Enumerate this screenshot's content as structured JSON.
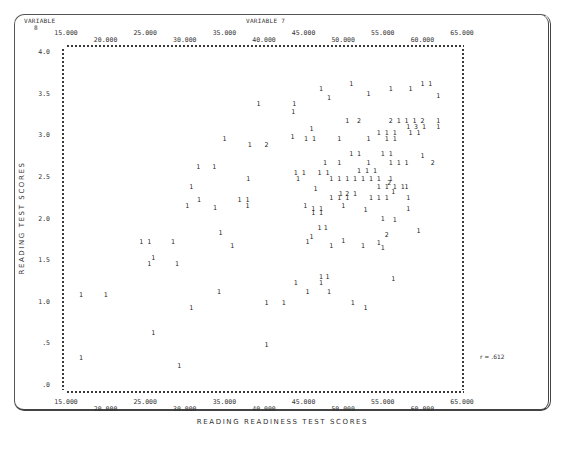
{
  "chart_data": {
    "type": "scatter",
    "title": "",
    "variable_y_label": "VARIABLE\n8",
    "variable_x_label": "VARIABLE 7",
    "xlabel": "READING READINESS TEST SCORES",
    "ylabel": "READING TEST SCORES",
    "annotation": "r = .612",
    "xlim": [
      15,
      65
    ],
    "ylim": [
      0,
      4
    ],
    "grid": false,
    "x_ticks_top_upper": [
      "15.000",
      "25.000",
      "35.000",
      "45.000",
      "55.000",
      "65.000"
    ],
    "x_ticks_top_lower": [
      "20.000",
      "30.000",
      "40.000",
      "50.000",
      "60.000"
    ],
    "x_ticks_bottom_upper": [
      "15.000",
      "25.000",
      "35.000",
      "45.000",
      "55.000",
      "65.000"
    ],
    "x_ticks_bottom_lower": [
      "20.000",
      "30.000",
      "40.000",
      "50.000",
      "60.000"
    ],
    "x_tick_values": [
      15,
      20,
      25,
      30,
      35,
      40,
      45,
      50,
      55,
      60,
      65
    ],
    "y_ticks": [
      "4.0",
      "3.5",
      "3.0",
      "2.5",
      "2.0",
      "1.5",
      "1.0",
      ".5",
      ".0"
    ],
    "y_tick_values": [
      4.0,
      3.5,
      3.0,
      2.5,
      2.0,
      1.5,
      1.0,
      0.5,
      0.0
    ],
    "points": [
      {
        "x": 16.9,
        "y": 1.08,
        "n": 1
      },
      {
        "x": 20.0,
        "y": 1.08,
        "n": 1
      },
      {
        "x": 16.9,
        "y": 0.33,
        "n": 1
      },
      {
        "x": 24.5,
        "y": 1.72,
        "n": 1
      },
      {
        "x": 25.5,
        "y": 1.72,
        "n": 1
      },
      {
        "x": 28.5,
        "y": 1.72,
        "n": 1
      },
      {
        "x": 26.0,
        "y": 1.52,
        "n": 1
      },
      {
        "x": 25.5,
        "y": 1.45,
        "n": 1
      },
      {
        "x": 29.0,
        "y": 1.45,
        "n": 1
      },
      {
        "x": 26.0,
        "y": 0.62,
        "n": 1
      },
      {
        "x": 29.3,
        "y": 0.23,
        "n": 1
      },
      {
        "x": 31.7,
        "y": 2.62,
        "n": 1
      },
      {
        "x": 33.7,
        "y": 2.62,
        "n": 1
      },
      {
        "x": 30.8,
        "y": 2.38,
        "n": 1
      },
      {
        "x": 31.8,
        "y": 2.22,
        "n": 1
      },
      {
        "x": 30.3,
        "y": 2.15,
        "n": 1
      },
      {
        "x": 33.8,
        "y": 2.13,
        "n": 1
      },
      {
        "x": 36.9,
        "y": 2.22,
        "n": 1
      },
      {
        "x": 37.9,
        "y": 2.22,
        "n": 1
      },
      {
        "x": 37.9,
        "y": 2.15,
        "n": 1
      },
      {
        "x": 35.0,
        "y": 2.95,
        "n": 1
      },
      {
        "x": 38.2,
        "y": 2.88,
        "n": 1
      },
      {
        "x": 40.3,
        "y": 2.88,
        "n": 2
      },
      {
        "x": 38.0,
        "y": 2.48,
        "n": 1
      },
      {
        "x": 34.5,
        "y": 1.82,
        "n": 1
      },
      {
        "x": 36.0,
        "y": 1.67,
        "n": 1
      },
      {
        "x": 34.3,
        "y": 1.12,
        "n": 1
      },
      {
        "x": 30.8,
        "y": 0.93,
        "n": 1
      },
      {
        "x": 39.3,
        "y": 3.37,
        "n": 1
      },
      {
        "x": 43.7,
        "y": 3.28,
        "n": 1
      },
      {
        "x": 43.8,
        "y": 3.37,
        "n": 1
      },
      {
        "x": 47.2,
        "y": 3.55,
        "n": 1
      },
      {
        "x": 48.2,
        "y": 3.45,
        "n": 1
      },
      {
        "x": 51.0,
        "y": 3.62,
        "n": 1
      },
      {
        "x": 53.2,
        "y": 3.5,
        "n": 1
      },
      {
        "x": 56.0,
        "y": 3.55,
        "n": 1
      },
      {
        "x": 58.5,
        "y": 3.55,
        "n": 1
      },
      {
        "x": 60.0,
        "y": 3.62,
        "n": 1
      },
      {
        "x": 61.0,
        "y": 3.62,
        "n": 1
      },
      {
        "x": 62.0,
        "y": 3.47,
        "n": 1
      },
      {
        "x": 50.5,
        "y": 3.17,
        "n": 1
      },
      {
        "x": 52.0,
        "y": 3.17,
        "n": 2
      },
      {
        "x": 56.0,
        "y": 3.17,
        "n": 2
      },
      {
        "x": 57.0,
        "y": 3.17,
        "n": 1
      },
      {
        "x": 58.0,
        "y": 3.17,
        "n": 1
      },
      {
        "x": 59.0,
        "y": 3.17,
        "n": 1
      },
      {
        "x": 60.0,
        "y": 3.17,
        "n": 2
      },
      {
        "x": 62.0,
        "y": 3.17,
        "n": 1
      },
      {
        "x": 58.2,
        "y": 3.1,
        "n": 1
      },
      {
        "x": 59.2,
        "y": 3.1,
        "n": 3
      },
      {
        "x": 60.2,
        "y": 3.1,
        "n": 1
      },
      {
        "x": 62.0,
        "y": 3.1,
        "n": 1
      },
      {
        "x": 46.0,
        "y": 3.07,
        "n": 1
      },
      {
        "x": 54.5,
        "y": 3.03,
        "n": 1
      },
      {
        "x": 55.5,
        "y": 3.03,
        "n": 1
      },
      {
        "x": 56.5,
        "y": 3.03,
        "n": 1
      },
      {
        "x": 58.5,
        "y": 3.03,
        "n": 1
      },
      {
        "x": 59.5,
        "y": 3.03,
        "n": 1
      },
      {
        "x": 43.6,
        "y": 2.98,
        "n": 1
      },
      {
        "x": 45.3,
        "y": 2.95,
        "n": 1
      },
      {
        "x": 46.3,
        "y": 2.95,
        "n": 1
      },
      {
        "x": 49.5,
        "y": 2.95,
        "n": 1
      },
      {
        "x": 53.2,
        "y": 2.95,
        "n": 1
      },
      {
        "x": 55.5,
        "y": 2.95,
        "n": 1
      },
      {
        "x": 56.5,
        "y": 2.95,
        "n": 1
      },
      {
        "x": 47.7,
        "y": 2.67,
        "n": 1
      },
      {
        "x": 49.5,
        "y": 2.67,
        "n": 1
      },
      {
        "x": 53.2,
        "y": 2.67,
        "n": 1
      },
      {
        "x": 56.0,
        "y": 2.67,
        "n": 1
      },
      {
        "x": 57.0,
        "y": 2.67,
        "n": 1
      },
      {
        "x": 58.0,
        "y": 2.67,
        "n": 1
      },
      {
        "x": 61.3,
        "y": 2.67,
        "n": 2
      },
      {
        "x": 52.0,
        "y": 2.57,
        "n": 1
      },
      {
        "x": 53.0,
        "y": 2.57,
        "n": 1
      },
      {
        "x": 54.0,
        "y": 2.57,
        "n": 1
      },
      {
        "x": 48.5,
        "y": 2.48,
        "n": 1
      },
      {
        "x": 49.5,
        "y": 2.48,
        "n": 1
      },
      {
        "x": 50.5,
        "y": 2.48,
        "n": 1
      },
      {
        "x": 51.5,
        "y": 2.48,
        "n": 1
      },
      {
        "x": 52.5,
        "y": 2.48,
        "n": 1
      },
      {
        "x": 53.5,
        "y": 2.48,
        "n": 1
      },
      {
        "x": 54.5,
        "y": 2.48,
        "n": 1
      },
      {
        "x": 56.0,
        "y": 2.48,
        "n": 1
      },
      {
        "x": 54.5,
        "y": 2.38,
        "n": 1
      },
      {
        "x": 55.5,
        "y": 2.38,
        "n": 1
      },
      {
        "x": 56.5,
        "y": 2.38,
        "n": 1
      },
      {
        "x": 57.5,
        "y": 2.38,
        "n": 1
      },
      {
        "x": 58.0,
        "y": 2.38,
        "n": 1
      },
      {
        "x": 44.0,
        "y": 2.55,
        "n": 1
      },
      {
        "x": 45.0,
        "y": 2.55,
        "n": 1
      },
      {
        "x": 47.0,
        "y": 2.55,
        "n": 1
      },
      {
        "x": 48.0,
        "y": 2.55,
        "n": 1
      },
      {
        "x": 44.3,
        "y": 2.48,
        "n": 1
      },
      {
        "x": 51.0,
        "y": 2.78,
        "n": 1
      },
      {
        "x": 52.0,
        "y": 2.78,
        "n": 1
      },
      {
        "x": 55.0,
        "y": 2.78,
        "n": 1
      },
      {
        "x": 56.0,
        "y": 2.78,
        "n": 1
      },
      {
        "x": 60.0,
        "y": 2.75,
        "n": 1
      },
      {
        "x": 46.5,
        "y": 2.35,
        "n": 1
      },
      {
        "x": 49.7,
        "y": 2.3,
        "n": 1
      },
      {
        "x": 50.5,
        "y": 2.3,
        "n": 2
      },
      {
        "x": 51.5,
        "y": 2.3,
        "n": 1
      },
      {
        "x": 56.3,
        "y": 2.32,
        "n": 1
      },
      {
        "x": 55.8,
        "y": 2.43,
        "n": 2
      },
      {
        "x": 48.5,
        "y": 2.25,
        "n": 1
      },
      {
        "x": 49.5,
        "y": 2.25,
        "n": 1
      },
      {
        "x": 50.5,
        "y": 2.25,
        "n": 1
      },
      {
        "x": 53.5,
        "y": 2.25,
        "n": 1
      },
      {
        "x": 54.5,
        "y": 2.25,
        "n": 1
      },
      {
        "x": 55.5,
        "y": 2.25,
        "n": 1
      },
      {
        "x": 58.2,
        "y": 2.25,
        "n": 1
      },
      {
        "x": 45.2,
        "y": 2.15,
        "n": 1
      },
      {
        "x": 46.2,
        "y": 2.12,
        "n": 1
      },
      {
        "x": 47.2,
        "y": 2.12,
        "n": 1
      },
      {
        "x": 46.2,
        "y": 2.07,
        "n": 1
      },
      {
        "x": 47.2,
        "y": 2.07,
        "n": 1
      },
      {
        "x": 50.0,
        "y": 2.15,
        "n": 1
      },
      {
        "x": 52.8,
        "y": 2.1,
        "n": 1
      },
      {
        "x": 58.2,
        "y": 2.12,
        "n": 1
      },
      {
        "x": 55.0,
        "y": 2.0,
        "n": 1
      },
      {
        "x": 56.5,
        "y": 1.98,
        "n": 1
      },
      {
        "x": 47.0,
        "y": 1.88,
        "n": 1
      },
      {
        "x": 47.8,
        "y": 1.88,
        "n": 1
      },
      {
        "x": 46.0,
        "y": 1.78,
        "n": 1
      },
      {
        "x": 45.5,
        "y": 1.72,
        "n": 1
      },
      {
        "x": 50.0,
        "y": 1.73,
        "n": 1
      },
      {
        "x": 54.5,
        "y": 1.7,
        "n": 1
      },
      {
        "x": 55.5,
        "y": 1.8,
        "n": 2
      },
      {
        "x": 59.5,
        "y": 1.85,
        "n": 1
      },
      {
        "x": 55.0,
        "y": 1.65,
        "n": 1
      },
      {
        "x": 48.5,
        "y": 1.67,
        "n": 1
      },
      {
        "x": 52.5,
        "y": 1.67,
        "n": 1
      },
      {
        "x": 47.2,
        "y": 1.3,
        "n": 1
      },
      {
        "x": 47.2,
        "y": 1.22,
        "n": 1
      },
      {
        "x": 45.5,
        "y": 1.12,
        "n": 1
      },
      {
        "x": 48.2,
        "y": 1.12,
        "n": 1
      },
      {
        "x": 48.0,
        "y": 1.3,
        "n": 1
      },
      {
        "x": 56.3,
        "y": 1.27,
        "n": 1
      },
      {
        "x": 44.0,
        "y": 1.22,
        "n": 1
      },
      {
        "x": 42.5,
        "y": 0.98,
        "n": 1
      },
      {
        "x": 40.3,
        "y": 0.98,
        "n": 1
      },
      {
        "x": 51.2,
        "y": 0.98,
        "n": 1
      },
      {
        "x": 52.8,
        "y": 0.92,
        "n": 1
      },
      {
        "x": 40.3,
        "y": 0.48,
        "n": 1
      }
    ]
  },
  "page": {
    "variable_y_line1": "VARIABLE",
    "variable_y_line2": "8",
    "variable_x": "VARIABLE 7",
    "xlabel": "READING  READINESS  TEST  SCORES",
    "ylabel": "READING  TEST  SCORES",
    "r_label": "r = .612",
    "caption": "FIGURE 1-3  A scatterplot of reading readiness and reading test scores"
  }
}
